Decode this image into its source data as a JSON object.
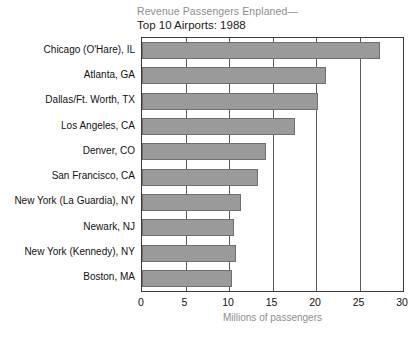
{
  "chart_data": {
    "type": "bar",
    "orientation": "horizontal",
    "title": "Revenue Passengers Enplaned—",
    "subtitle": "Top 10 Airports: 1988",
    "xlabel": "Millions of passengers",
    "ylabel": "",
    "xlim": [
      0,
      30
    ],
    "xticks": [
      0,
      5,
      10,
      15,
      20,
      25,
      30
    ],
    "xtick_labels": [
      "0",
      "5",
      "10",
      "15",
      "20",
      "25",
      "30"
    ],
    "grid": "vertical",
    "legend": "none",
    "bar_color": "#9a9a9a",
    "bar_edge_color": "#6f6f6f",
    "categories": [
      "Chicago (O'Hare), IL",
      "Atlanta, GA",
      "Dallas/Ft. Worth, TX",
      "Los Angeles, CA",
      "Denver, CO",
      "San Francisco, CA",
      "New York (La Guardia), NY",
      "Newark, NJ",
      "New York (Kennedy), NY",
      "Boston, MA"
    ],
    "values": [
      27.4,
      21.1,
      20.2,
      17.6,
      14.2,
      13.3,
      11.4,
      10.6,
      10.8,
      10.3
    ]
  }
}
